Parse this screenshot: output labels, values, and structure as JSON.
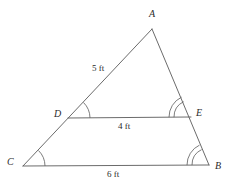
{
  "figure": {
    "kind": "geometry-diagram",
    "background_color": "#ffffff",
    "stroke_color": "#5a5a5a",
    "text_color": "#2b2b2b"
  },
  "vertices": {
    "a": {
      "label": "A",
      "x": 152,
      "y": 29,
      "label_x": 149,
      "label_y": 9
    },
    "b": {
      "label": "B",
      "x": 209,
      "y": 165,
      "label_x": 215,
      "label_y": 161
    },
    "c": {
      "label": "C",
      "x": 23,
      "y": 166,
      "label_x": 7,
      "label_y": 157
    },
    "d": {
      "label": "D",
      "x": 68,
      "y": 118,
      "label_x": 54,
      "label_y": 109
    },
    "e": {
      "label": "E",
      "x": 191,
      "y": 117,
      "label_x": 196,
      "label_y": 108
    }
  },
  "segments": [
    {
      "name": "side-ca",
      "from": "C",
      "to": "A",
      "x1": 23,
      "y1": 166,
      "x2": 152,
      "y2": 29
    },
    {
      "name": "side-ab",
      "from": "A",
      "to": "B",
      "x1": 152,
      "y1": 29,
      "x2": 209,
      "y2": 165
    },
    {
      "name": "base-cb",
      "from": "C",
      "to": "B",
      "x1": 23,
      "y1": 166,
      "x2": 209,
      "y2": 165
    },
    {
      "name": "segment-de",
      "from": "D",
      "to": "E",
      "x1": 68,
      "y1": 118,
      "x2": 191,
      "y2": 117
    }
  ],
  "measures": [
    {
      "name": "length-da",
      "text": "5 ft",
      "x": 92,
      "y": 64
    },
    {
      "name": "length-de",
      "text": "4 ft",
      "x": 118,
      "y": 122
    },
    {
      "name": "length-cb",
      "text": "6 ft",
      "x": 107,
      "y": 170
    }
  ],
  "angle_marks": [
    {
      "name": "angle-c",
      "vertex": "C",
      "arcs": 1
    },
    {
      "name": "angle-d",
      "vertex": "D",
      "arcs": 1
    },
    {
      "name": "angle-e",
      "vertex": "E",
      "arcs": 2
    },
    {
      "name": "angle-b",
      "vertex": "B",
      "arcs": 2
    }
  ]
}
